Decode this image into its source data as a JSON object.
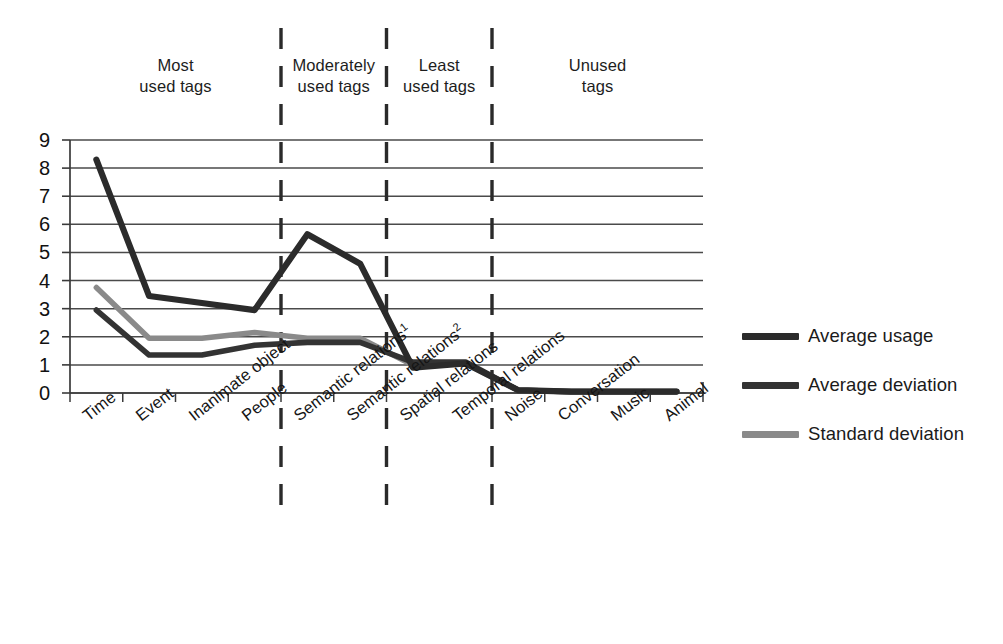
{
  "chart_data": {
    "type": "line",
    "title": "",
    "xlabel": "",
    "ylabel": "",
    "ylim": [
      0,
      9
    ],
    "yticks": [
      0,
      1,
      2,
      3,
      4,
      5,
      6,
      7,
      8,
      9
    ],
    "grid": true,
    "legend_position": "right",
    "categories": [
      "Time",
      "Event",
      "Inanimate object",
      "People",
      "Semantic relations¹",
      "Semantic relations²",
      "Spatial relations",
      "Temporal relations",
      "Noise",
      "Conversation",
      "Music",
      "Animal"
    ],
    "series": [
      {
        "name": "Average usage",
        "color": "#2b2b2b",
        "values": [
          8.3,
          3.45,
          3.2,
          2.95,
          5.65,
          4.6,
          0.9,
          1.05,
          0.1,
          0.05,
          0.05,
          0.05
        ]
      },
      {
        "name": "Average deviation",
        "color": "#333333",
        "values": [
          2.95,
          1.35,
          1.35,
          1.7,
          1.8,
          1.8,
          1.1,
          1.1,
          0.1,
          0.05,
          0.05,
          0.05
        ]
      },
      {
        "name": "Standard deviation",
        "color": "#8a8a8a",
        "values": [
          3.75,
          1.95,
          1.95,
          2.15,
          1.95,
          1.95,
          1.0,
          1.05,
          0.1,
          0.05,
          0.05,
          0.05
        ]
      }
    ],
    "band_dividers_after_category_index": [
      3,
      5,
      7
    ],
    "bands": [
      {
        "label": "Most\nused tags"
      },
      {
        "label": "Moderately\nused tags"
      },
      {
        "label": "Least\nused tags"
      },
      {
        "label": "Unused\ntags"
      }
    ]
  },
  "legend": {
    "items": [
      {
        "label": "Average usage",
        "color": "#2b2b2b"
      },
      {
        "label": "Average deviation",
        "color": "#333333"
      },
      {
        "label": "Standard deviation",
        "color": "#8a8a8a"
      }
    ]
  }
}
